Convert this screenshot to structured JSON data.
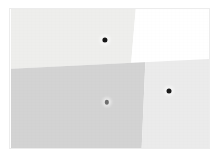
{
  "figure": {
    "type": "quadrant-field-image",
    "canvas": {
      "width": 221,
      "height": 157,
      "background": "#ffffff"
    },
    "plate": {
      "x": 11,
      "y": 9,
      "width": 198,
      "height": 139,
      "border_color": "#ececec"
    }
  },
  "regions": [
    {
      "id": "region-top-left",
      "label": "upper-left",
      "fill": "#eeeeec",
      "polygon": "0% 0%, 63% 0%, 57% 100%, 0% 100%"
    },
    {
      "id": "region-top-right",
      "label": "upper-right",
      "fill": "#ffffff",
      "polygon": "63% 0%, 100% 0%, 100% 100%, 57% 100%"
    },
    {
      "id": "region-bottom-left",
      "label": "lower-left",
      "fill": "#d3d3d3",
      "polygon": "0% 0%, 69% 0%, 66% 100%, 0% 100%"
    },
    {
      "id": "region-bottom-right",
      "label": "lower-right",
      "fill": "#ebebeb",
      "polygon": "69% 0%, 100% 0%, 100% 100%, 66% 100%"
    }
  ],
  "boundaries": {
    "horizontal": {
      "left_y_pct": 43,
      "right_y_pct": 36
    },
    "vertical_top": {
      "top_x_pct": 63,
      "bottom_x_pct": 57
    },
    "vertical_bottom": {
      "top_x_pct": 69,
      "bottom_x_pct": 66
    }
  },
  "markers": [
    {
      "id": "marker-1",
      "x_pct": 47.5,
      "y_pct": 22.0,
      "diameter": 5.2,
      "color": "#161616",
      "halo": 11
    },
    {
      "id": "marker-2",
      "x_pct": 48.5,
      "y_pct": 67.0,
      "diameter": 4.4,
      "color": "#6f6f6f",
      "halo": 9
    },
    {
      "id": "marker-3",
      "x_pct": 79.8,
      "y_pct": 59.0,
      "diameter": 5.0,
      "color": "#1b1b1b",
      "halo": 10
    }
  ]
}
